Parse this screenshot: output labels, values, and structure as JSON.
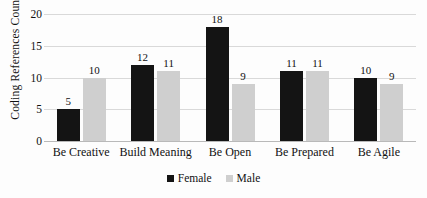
{
  "chart_data": {
    "type": "bar",
    "title": "",
    "xlabel": "",
    "ylabel": "Coding References Count",
    "categories": [
      "Be Creative",
      "Build Meaning",
      "Be Open",
      "Be Prepared",
      "Be Agile"
    ],
    "series": [
      {
        "name": "Female",
        "color": "#141414",
        "values": [
          5,
          12,
          18,
          11,
          10
        ]
      },
      {
        "name": "Male",
        "color": "#cfcfcf",
        "values": [
          10,
          11,
          9,
          11,
          9
        ]
      }
    ],
    "ylim": [
      0,
      20
    ],
    "yticks": [
      0,
      5,
      10,
      15,
      20
    ],
    "ytick_labels": [
      "0",
      "5",
      "10",
      "15",
      "20"
    ],
    "grid": true,
    "grid_axis": "y",
    "legend_position": "bottom",
    "data_labels": true
  },
  "axis": {
    "y_title": "Coding References Count"
  },
  "legend": {
    "items": [
      {
        "label": "Female"
      },
      {
        "label": "Male"
      }
    ]
  }
}
